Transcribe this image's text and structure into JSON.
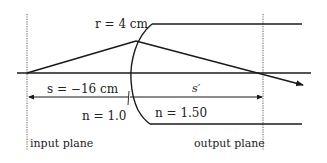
{
  "diagram": {
    "labels": {
      "radius": "r = 4 cm",
      "object_distance": "s = −16 cm",
      "image_distance": "s′",
      "n_left": "n = 1.0",
      "n_right": "n = 1.50",
      "input_plane": "input plane",
      "output_plane": "output plane"
    },
    "values": {
      "radius_cm": 4,
      "s_cm": -16,
      "n1": 1.0,
      "n2": 1.5
    },
    "colors": {
      "line": "#1a1a1a",
      "dotted": "#777777",
      "background": "#ffffff"
    }
  }
}
